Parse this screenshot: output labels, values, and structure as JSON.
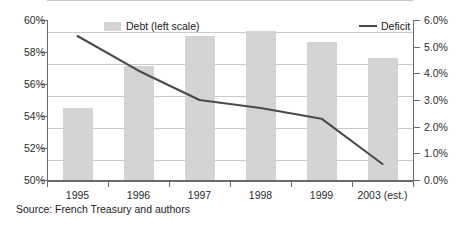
{
  "chart_data": {
    "type": "bar",
    "title": "",
    "subtitle": "",
    "xlabel": "",
    "ylabel": "",
    "grid": true,
    "legend_position": "inside-top",
    "categories": [
      "1995",
      "1996",
      "1997",
      "1998",
      "1999",
      "2003 (est.)"
    ],
    "series": [
      {
        "name": "Debt (left scale)",
        "type": "bar",
        "axis": "left",
        "unit": "%",
        "color": "#d4d4d4",
        "values": [
          54.5,
          57.1,
          59.0,
          59.3,
          58.6,
          57.6
        ]
      },
      {
        "name": "Deficit",
        "type": "line",
        "axis": "right",
        "unit": "%",
        "color": "#4a4a4a",
        "values": [
          5.4,
          4.1,
          3.0,
          2.7,
          2.3,
          0.6
        ]
      }
    ],
    "left_axis": {
      "label": "",
      "ylim": [
        50,
        60
      ],
      "tick_step": 2,
      "ticks": [
        "50%",
        "52%",
        "54%",
        "56%",
        "58%",
        "60%"
      ],
      "tick_values": [
        50,
        52,
        54,
        56,
        58,
        60
      ]
    },
    "right_axis": {
      "label": "",
      "ylim": [
        0,
        6
      ],
      "tick_step": 1,
      "ticks": [
        "0.0%",
        "1.0%",
        "2.0%",
        "3.0%",
        "4.0%",
        "5.0%",
        "6.0%"
      ],
      "tick_values": [
        0,
        1,
        2,
        3,
        4,
        5,
        6
      ]
    }
  },
  "legend": {
    "debt_label": "Debt (left scale)",
    "deficit_label": "Deficit"
  },
  "source": {
    "text": "Source: French Treasury and authors"
  },
  "colors": {
    "bar_fill": "#d4d4d4",
    "line": "#4a4a4a",
    "gridline": "#c9c9c9",
    "axis": "#6b6b6b",
    "background": "#ffffff",
    "text": "#1a1a1a"
  }
}
